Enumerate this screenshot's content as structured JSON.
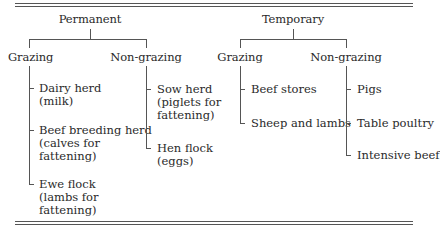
{
  "diagram": {
    "permanent": {
      "label": "Permanent",
      "grazing": {
        "label": "Grazing",
        "items": [
          {
            "line1": "Dairy herd",
            "line2": "(milk)",
            "line3": ""
          },
          {
            "line1": "Beef breeding herd",
            "line2": "(calves for",
            "line3": "fattening)"
          },
          {
            "line1": "Ewe flock",
            "line2": "(lambs for",
            "line3": "fattening)"
          }
        ]
      },
      "non_grazing": {
        "label": "Non-grazing",
        "items": [
          {
            "line1": "Sow herd",
            "line2": "(piglets for",
            "line3": "fattening)"
          },
          {
            "line1": "Hen flock",
            "line2": "(eggs)",
            "line3": ""
          }
        ]
      }
    },
    "temporary": {
      "label": "Temporary",
      "grazing": {
        "label": "Grazing",
        "items": [
          {
            "line1": "Beef stores"
          },
          {
            "line1": "Sheep and lambs"
          }
        ]
      },
      "non_grazing": {
        "label": "Non-grazing",
        "items": [
          {
            "line1": "Pigs"
          },
          {
            "line1": "Table poultry"
          },
          {
            "line1": "Intensive beef"
          }
        ]
      }
    }
  }
}
